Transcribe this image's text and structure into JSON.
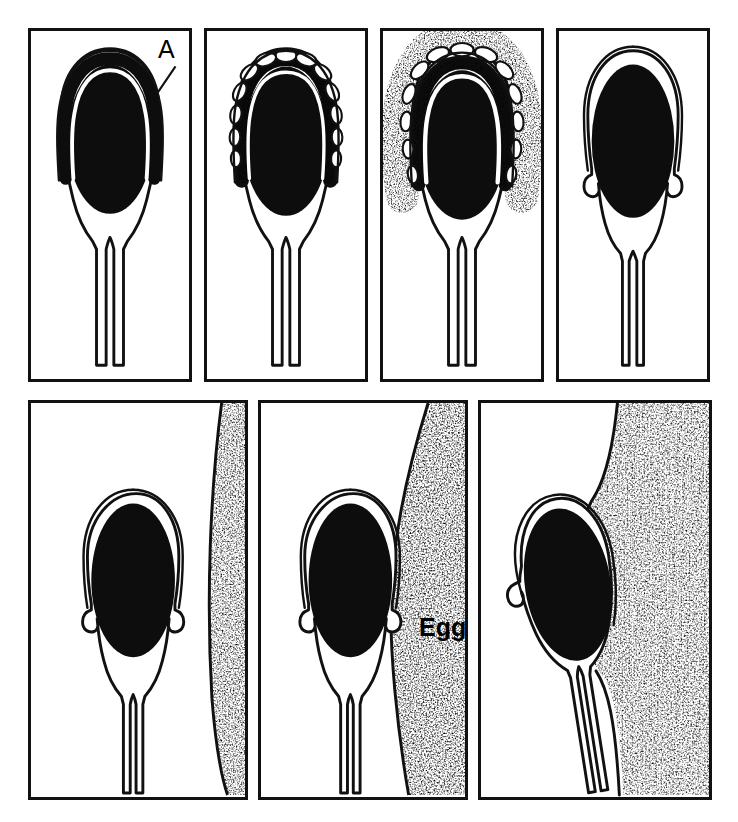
{
  "figure": {
    "type": "line-diagram",
    "panel_count": 7,
    "rows": 2,
    "ink_color": "#111111",
    "nucleus_color": "#0d0d0d",
    "egg_fill": "stipple",
    "background": "#ffffff"
  },
  "labels": {
    "acrosome": "A",
    "egg": "Egg"
  },
  "panels": [
    {
      "index": 1,
      "name": "intact-acrosome",
      "caption": "Intact acrosomal cap over nucleus",
      "has_label": "A",
      "row": 1
    },
    {
      "index": 2,
      "name": "vesiculation-begins",
      "caption": "Acrosomal membrane vesiculates",
      "row": 1
    },
    {
      "index": 3,
      "name": "vesicles-dispersing",
      "caption": "Vesicles disperse with released contents",
      "row": 1
    },
    {
      "index": 4,
      "name": "bare-nucleus",
      "caption": "Reacted sperm with equatorial hooks",
      "row": 1
    },
    {
      "index": 5,
      "name": "approach-egg",
      "caption": "Reacted sperm approaches egg surface",
      "row": 2
    },
    {
      "index": 6,
      "name": "contact-egg",
      "caption": "Sperm contacts egg plasma membrane",
      "has_label": "Egg",
      "row": 2
    },
    {
      "index": 7,
      "name": "engulfment",
      "caption": "Egg membrane engulfs sperm head",
      "row": 2
    }
  ]
}
